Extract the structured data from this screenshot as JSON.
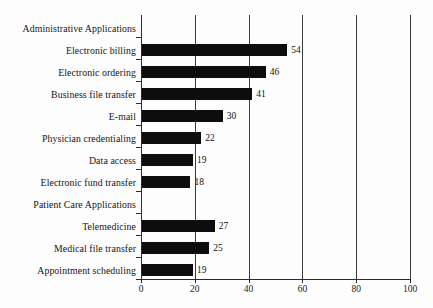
{
  "chart_data": {
    "type": "bar",
    "orientation": "horizontal",
    "title": "",
    "xlabel": "",
    "ylabel": "",
    "xlim": [
      0,
      100
    ],
    "xticks": [
      0,
      20,
      40,
      60,
      80,
      100
    ],
    "grid": true,
    "legend": false,
    "bar_color": "#0d0d0d",
    "categories": [
      "Administrative Applications",
      "Electronic billing",
      "Electronic ordering",
      "Business file transfer",
      "E-mail",
      "Physician credentialing",
      "Data access",
      "Electronic fund transfer",
      "Patient Care Applications",
      "Telemedicine",
      "Medical file transfer",
      "Appointment scheduling"
    ],
    "values": [
      null,
      54,
      46,
      41,
      30,
      22,
      19,
      18,
      null,
      27,
      25,
      19
    ],
    "rows": [
      {
        "label": "Administrative Applications",
        "value": null,
        "value_text": "",
        "is_header": true
      },
      {
        "label": "Electronic billing",
        "value": 54,
        "value_text": "54",
        "is_header": false
      },
      {
        "label": "Electronic ordering",
        "value": 46,
        "value_text": "46",
        "is_header": false
      },
      {
        "label": "Business file transfer",
        "value": 41,
        "value_text": "41",
        "is_header": false
      },
      {
        "label": "E-mail",
        "value": 30,
        "value_text": "30",
        "is_header": false
      },
      {
        "label": "Physician credentialing",
        "value": 22,
        "value_text": "22",
        "is_header": false
      },
      {
        "label": "Data access",
        "value": 19,
        "value_text": "19",
        "is_header": false
      },
      {
        "label": "Electronic fund transfer",
        "value": 18,
        "value_text": "18",
        "is_header": false
      },
      {
        "label": "Patient Care Applications",
        "value": null,
        "value_text": "",
        "is_header": true
      },
      {
        "label": "Telemedicine",
        "value": 27,
        "value_text": "27",
        "is_header": false
      },
      {
        "label": "Medical file transfer",
        "value": 25,
        "value_text": "25",
        "is_header": false
      },
      {
        "label": "Appointment scheduling",
        "value": 19,
        "value_text": "19",
        "is_header": false
      }
    ],
    "xtick_labels": [
      "0",
      "20",
      "40",
      "60",
      "80",
      "100"
    ]
  }
}
